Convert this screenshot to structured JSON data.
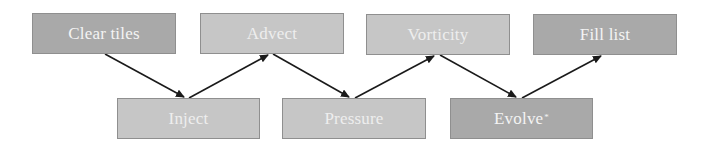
{
  "diagram": {
    "nodes": [
      {
        "id": "clear-tiles",
        "label": "Clear tiles",
        "row": "top",
        "shade": "dark",
        "x": 32,
        "y": 13,
        "w": 144,
        "h": 41
      },
      {
        "id": "advect",
        "label": "Advect",
        "row": "top",
        "shade": "light",
        "x": 200,
        "y": 13,
        "w": 144,
        "h": 41
      },
      {
        "id": "vorticity",
        "label": "Vorticity",
        "row": "top",
        "shade": "light",
        "x": 366,
        "y": 14,
        "w": 144,
        "h": 41
      },
      {
        "id": "fill-list",
        "label": "Fill list",
        "row": "top",
        "shade": "dark",
        "x": 533,
        "y": 14,
        "w": 144,
        "h": 41
      },
      {
        "id": "inject",
        "label": "Inject",
        "row": "bottom",
        "shade": "light",
        "x": 117,
        "y": 98,
        "w": 143,
        "h": 41
      },
      {
        "id": "pressure",
        "label": "Pressure",
        "row": "bottom",
        "shade": "light",
        "x": 282,
        "y": 98,
        "w": 144,
        "h": 41
      },
      {
        "id": "evolve",
        "label": "Evolve",
        "label_suffix": "*",
        "row": "bottom",
        "shade": "dark",
        "x": 450,
        "y": 98,
        "w": 143,
        "h": 41
      }
    ],
    "edges": [
      {
        "from": "clear-tiles",
        "to": "inject",
        "x1": 105,
        "y1": 54,
        "x2": 184,
        "y2": 97
      },
      {
        "from": "inject",
        "to": "advect",
        "x1": 189,
        "y1": 98,
        "x2": 268,
        "y2": 55
      },
      {
        "from": "advect",
        "to": "pressure",
        "x1": 273,
        "y1": 54,
        "x2": 349,
        "y2": 97
      },
      {
        "from": "pressure",
        "to": "vorticity",
        "x1": 355,
        "y1": 98,
        "x2": 434,
        "y2": 56
      },
      {
        "from": "vorticity",
        "to": "evolve",
        "x1": 440,
        "y1": 55,
        "x2": 516,
        "y2": 97
      },
      {
        "from": "evolve",
        "to": "fill-list",
        "x1": 522,
        "y1": 98,
        "x2": 601,
        "y2": 56
      }
    ],
    "colors": {
      "dark_box": "#a9a9a9",
      "light_box": "#c6c6c6",
      "border": "#8f8f8f",
      "text": "#f4f4f4",
      "arrow": "#1a1a1a"
    }
  }
}
